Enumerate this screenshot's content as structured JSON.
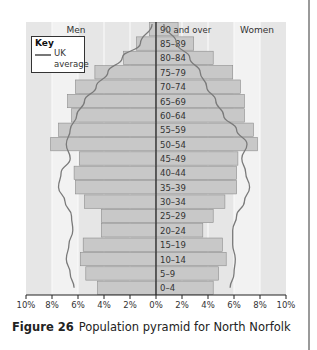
{
  "caption": {
    "figure_label": "Figure 26",
    "text": "Population pyramid for North Norfolk"
  },
  "key": {
    "title": "Key",
    "line_label_1": "UK",
    "line_label_2": "average"
  },
  "colors": {
    "plot_background": "#e6e6e6",
    "band_light": "#f2f2f2",
    "bar_fill": "#c8c8c8",
    "bar_stroke": "#8c8c8c",
    "uk_line": "#7a7a7a",
    "axis": "#222222"
  },
  "chart_data": {
    "type": "bar",
    "orientation": "horizontal-pyramid",
    "title": "Population pyramid for North Norfolk",
    "left_label": "Men",
    "right_label": "Women",
    "xlabel": "",
    "ylabel": "",
    "xlim": [
      -10,
      10
    ],
    "x_ticks": [
      "10%",
      "8%",
      "6%",
      "4%",
      "2%",
      "0%",
      "2%",
      "4%",
      "6%",
      "8%",
      "10%"
    ],
    "grid": true,
    "legend_position": "top-left",
    "categories": [
      "90 and over",
      "85–89",
      "80–84",
      "75–79",
      "70–74",
      "65–69",
      "60–64",
      "55–59",
      "50–54",
      "45–49",
      "40–44",
      "35–39",
      "30–34",
      "25–29",
      "20–24",
      "15–19",
      "10–14",
      "5–9",
      "0–4"
    ],
    "series": [
      {
        "name": "Men",
        "values": [
          0.5,
          1.5,
          2.5,
          4.7,
          6.2,
          6.8,
          6.5,
          7.5,
          8.1,
          5.9,
          6.3,
          6.2,
          5.5,
          4.2,
          4.2,
          5.6,
          5.8,
          5.4,
          4.5
        ]
      },
      {
        "name": "Women",
        "values": [
          1.7,
          2.9,
          4.4,
          5.9,
          6.5,
          6.8,
          6.8,
          7.5,
          7.8,
          6.3,
          6.2,
          6.2,
          5.3,
          4.4,
          3.6,
          5.1,
          5.4,
          4.8,
          4.4
        ]
      },
      {
        "name": "UK average (Men)",
        "type": "line",
        "values": [
          0.3,
          1.2,
          2.6,
          3.7,
          4.6,
          5.5,
          6.1,
          6.6,
          6.9,
          6.6,
          7.3,
          7.5,
          7.0,
          6.5,
          6.4,
          6.7,
          6.9,
          6.6,
          6.3
        ]
      },
      {
        "name": "UK average (Women)",
        "type": "line",
        "values": [
          0.6,
          1.6,
          2.6,
          3.4,
          3.9,
          4.6,
          5.2,
          6.2,
          7.0,
          6.6,
          6.9,
          7.2,
          6.8,
          6.2,
          5.9,
          5.9,
          6.1,
          6.0,
          5.7
        ]
      }
    ]
  }
}
